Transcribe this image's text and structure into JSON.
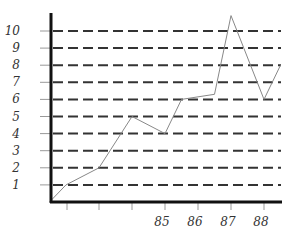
{
  "chart_data": {
    "type": "line",
    "title": "",
    "xlabel": "",
    "ylabel": "",
    "x_tick_labels": [
      "",
      "",
      "",
      "85",
      "86",
      "87",
      "88"
    ],
    "y_tick_labels": [
      "1",
      "2",
      "3",
      "4",
      "5",
      "6",
      "7",
      "8",
      "9",
      "10"
    ],
    "ylim": [
      0,
      11
    ],
    "grid": "horizontal dashed",
    "legend": null,
    "series": [
      {
        "name": "series",
        "x": [
          81.5,
          82,
          83,
          84,
          85,
          85.5,
          86.5,
          87,
          88,
          88.5
        ],
        "values": [
          0,
          1,
          2,
          5,
          4,
          6,
          6.3,
          10.9,
          6,
          8
        ]
      }
    ]
  },
  "colors": {
    "axis": "#111111",
    "grid": "#333333",
    "line": "#888888",
    "labels": "#333333"
  }
}
